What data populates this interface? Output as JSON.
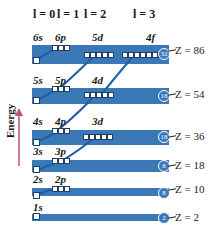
{
  "figure": {
    "axis_label": "Energy",
    "l_headers": [
      {
        "label": "l = 0"
      },
      {
        "label": "l = 1"
      },
      {
        "label": "l = 2"
      },
      {
        "label": "l = 3"
      }
    ],
    "shells": [
      {
        "z_label": "Z = 86",
        "capacity": "32",
        "orbitals": [
          "6s",
          "6p",
          "5d",
          "4f"
        ]
      },
      {
        "z_label": "Z = 54",
        "capacity": "18",
        "orbitals": [
          "5s",
          "5p",
          "4d"
        ]
      },
      {
        "z_label": "Z = 36",
        "capacity": "18",
        "orbitals": [
          "4s",
          "4p",
          "3d"
        ]
      },
      {
        "z_label": "Z = 18",
        "capacity": "8",
        "orbitals": [
          "3s",
          "3p"
        ]
      },
      {
        "z_label": "Z = 10",
        "capacity": "8",
        "orbitals": [
          "2s",
          "2p"
        ]
      },
      {
        "z_label": "Z = 2",
        "capacity": "2",
        "orbitals": [
          "1s"
        ]
      }
    ],
    "colors": {
      "shell_fill": "#3a79b5",
      "connector": "#1f5ea8",
      "energy_arrow": "#c0506e"
    }
  }
}
